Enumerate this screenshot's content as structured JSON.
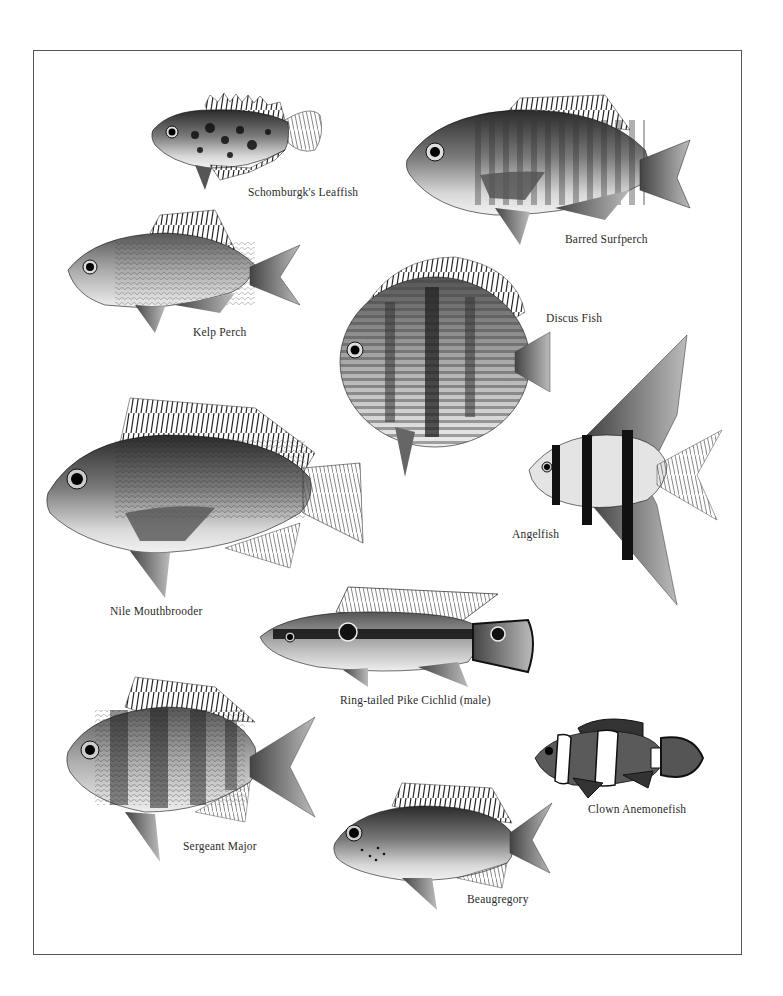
{
  "plate": {
    "species": [
      {
        "id": "leaffish",
        "name": "Schomburgk's Leaffish"
      },
      {
        "id": "surfperch",
        "name": "Barred Surfperch"
      },
      {
        "id": "kelp",
        "name": "Kelp Perch"
      },
      {
        "id": "discus",
        "name": "Discus Fish"
      },
      {
        "id": "angelfish",
        "name": "Angelfish"
      },
      {
        "id": "nile",
        "name": "Nile Mouthbrooder"
      },
      {
        "id": "pike",
        "name": "Ring-tailed Pike Cichlid (male)"
      },
      {
        "id": "sergeant",
        "name": "Sergeant Major"
      },
      {
        "id": "clown",
        "name": "Clown Anemonefish"
      },
      {
        "id": "beaugregory",
        "name": "Beaugregory"
      }
    ]
  }
}
